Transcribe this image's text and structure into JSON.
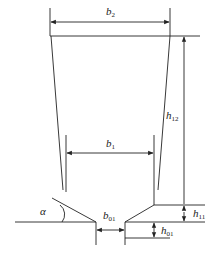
{
  "diagram": {
    "type": "nozzle cross-section dimension drawing",
    "labels": {
      "b2": "b",
      "b2_sub": "2",
      "b1": "b",
      "b1_sub": "1",
      "h12": "h",
      "h12_sub": "12",
      "h11": "h",
      "h11_sub": "11",
      "h01": "h",
      "h01_sub": "01",
      "b01": "b",
      "b01_sub": "01",
      "alpha": "α"
    },
    "colors": {
      "line": "#222222",
      "background": "#ffffff"
    }
  },
  "caption": ""
}
